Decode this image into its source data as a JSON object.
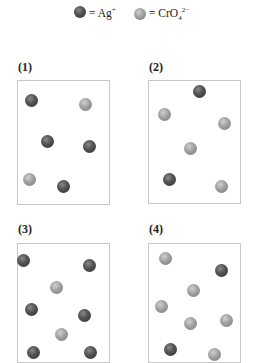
{
  "legend": [
    {
      "type": "dark",
      "label": "= Ag",
      "sup": "+",
      "sub": ""
    },
    {
      "type": "light",
      "label": "= CrO",
      "sub": "4",
      "sup": "2−"
    }
  ],
  "panels": [
    {
      "label": "(1)",
      "box": {
        "x": 17,
        "y": 80,
        "w": 93,
        "h": 125
      },
      "balls": [
        {
          "t": "dark",
          "x": 31,
          "y": 100
        },
        {
          "t": "light",
          "x": 85,
          "y": 104
        },
        {
          "t": "dark",
          "x": 47,
          "y": 141
        },
        {
          "t": "dark",
          "x": 89,
          "y": 146
        },
        {
          "t": "light",
          "x": 29,
          "y": 179
        },
        {
          "t": "dark",
          "x": 63,
          "y": 186
        }
      ]
    },
    {
      "label": "(2)",
      "box": {
        "x": 148,
        "y": 80,
        "w": 93,
        "h": 124
      },
      "balls": [
        {
          "t": "dark",
          "x": 199,
          "y": 91
        },
        {
          "t": "light",
          "x": 164,
          "y": 114
        },
        {
          "t": "light",
          "x": 224,
          "y": 123
        },
        {
          "t": "light",
          "x": 190,
          "y": 148
        },
        {
          "t": "dark",
          "x": 169,
          "y": 179
        },
        {
          "t": "light",
          "x": 221,
          "y": 186
        }
      ]
    },
    {
      "label": "(3)",
      "box": {
        "x": 17,
        "y": 243,
        "w": 93,
        "h": 120
      },
      "balls": [
        {
          "t": "dark",
          "x": 23,
          "y": 260
        },
        {
          "t": "dark",
          "x": 89,
          "y": 265
        },
        {
          "t": "light",
          "x": 56,
          "y": 287
        },
        {
          "t": "dark",
          "x": 31,
          "y": 309
        },
        {
          "t": "dark",
          "x": 84,
          "y": 315
        },
        {
          "t": "light",
          "x": 61,
          "y": 334
        },
        {
          "t": "dark",
          "x": 33,
          "y": 352
        },
        {
          "t": "dark",
          "x": 90,
          "y": 352
        }
      ]
    },
    {
      "label": "(4)",
      "box": {
        "x": 148,
        "y": 243,
        "w": 93,
        "h": 120
      },
      "balls": [
        {
          "t": "light",
          "x": 165,
          "y": 258
        },
        {
          "t": "dark",
          "x": 221,
          "y": 270
        },
        {
          "t": "light",
          "x": 193,
          "y": 290
        },
        {
          "t": "light",
          "x": 161,
          "y": 306
        },
        {
          "t": "light",
          "x": 190,
          "y": 323
        },
        {
          "t": "light",
          "x": 226,
          "y": 320
        },
        {
          "t": "dark",
          "x": 170,
          "y": 349
        },
        {
          "t": "light",
          "x": 214,
          "y": 354
        }
      ]
    }
  ],
  "labels_pos": [
    {
      "x": 18,
      "y": 60
    },
    {
      "x": 149,
      "y": 60
    },
    {
      "x": 18,
      "y": 222
    },
    {
      "x": 149,
      "y": 222
    }
  ]
}
